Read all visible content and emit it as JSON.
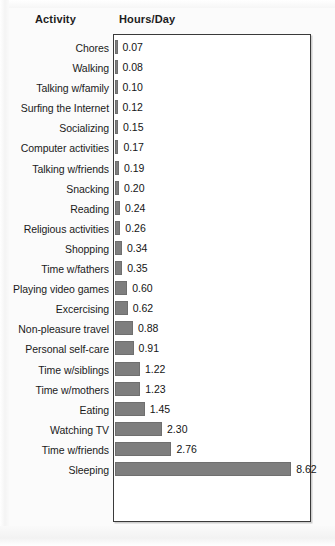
{
  "header": {
    "activity_label": "Activity",
    "hours_label": "Hours/Day"
  },
  "style": {
    "bar_color": "#7e7e7e",
    "frame_color": "#3a3a3a",
    "page_background": "#fbfbfb",
    "plot_background": "#ffffff",
    "text_color": "#1a1a1a"
  },
  "chart_data": {
    "type": "bar",
    "orientation": "horizontal",
    "title": "",
    "xlabel": "Hours/Day",
    "ylabel": "Activity",
    "grid": false,
    "legend": null,
    "xlim": [
      0,
      9.2
    ],
    "value_labels": true,
    "value_format": "0.00",
    "categories": [
      "Chores",
      "Walking",
      "Talking w/family",
      "Surfing the Internet",
      "Socializing",
      "Computer activities",
      "Talking w/friends",
      "Snacking",
      "Reading",
      "Religious activities",
      "Shopping",
      "Time w/fathers",
      "Playing video games",
      "Excercising",
      "Non-pleasure travel",
      "Personal self-care",
      "Time w/siblings",
      "Time w/mothers",
      "Eating",
      "Watching TV",
      "Time w/friends",
      "Sleeping"
    ],
    "values": [
      0.07,
      0.08,
      0.1,
      0.12,
      0.15,
      0.17,
      0.19,
      0.2,
      0.24,
      0.26,
      0.34,
      0.35,
      0.6,
      0.62,
      0.88,
      0.91,
      1.22,
      1.23,
      1.45,
      2.3,
      2.76,
      8.62
    ],
    "labels": [
      "0.07",
      "0.08",
      "0.10",
      "0.12",
      "0.15",
      "0.17",
      "0.19",
      "0.20",
      "0.24",
      "0.26",
      "0.34",
      "0.35",
      "0.60",
      "0.62",
      "0.88",
      "0.91",
      "1.22",
      "1.23",
      "1.45",
      "2.30",
      "2.76",
      "8.62"
    ]
  }
}
